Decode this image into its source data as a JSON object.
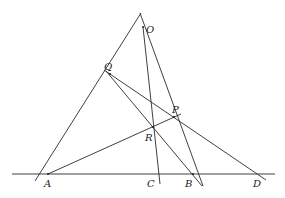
{
  "diagram": {
    "type": "projective-geometry-figure",
    "points": {
      "O": {
        "label": "O",
        "x": 143,
        "y": 27
      },
      "Q": {
        "label": "Q",
        "x": 110,
        "y": 74
      },
      "P": {
        "label": "P",
        "x": 174,
        "y": 117
      },
      "R": {
        "label": "R",
        "x": 153,
        "y": 127
      },
      "A": {
        "label": "A",
        "x": 48,
        "y": 174
      },
      "C": {
        "label": "C",
        "x": 157,
        "y": 174
      },
      "B": {
        "label": "B",
        "x": 193,
        "y": 174
      },
      "D": {
        "label": "D",
        "x": 260,
        "y": 174
      }
    },
    "lines": [
      {
        "name": "baseline-ABCD",
        "x1": 12,
        "y1": 174,
        "x2": 275,
        "y2": 174
      },
      {
        "name": "line-OA",
        "x1": 141,
        "y1": 13,
        "x2": 35,
        "y2": 181
      },
      {
        "name": "line-OB",
        "x1": 140,
        "y1": 13,
        "x2": 203,
        "y2": 186
      },
      {
        "name": "line-OC",
        "x1": 143,
        "y1": 27,
        "x2": 160,
        "y2": 184
      },
      {
        "name": "line-QD",
        "x1": 104,
        "y1": 70,
        "x2": 266,
        "y2": 180
      },
      {
        "name": "line-QB",
        "x1": 106,
        "y1": 71,
        "x2": 202,
        "y2": 186
      },
      {
        "name": "line-AP",
        "x1": 48,
        "y1": 174,
        "x2": 181,
        "y2": 114
      }
    ]
  }
}
